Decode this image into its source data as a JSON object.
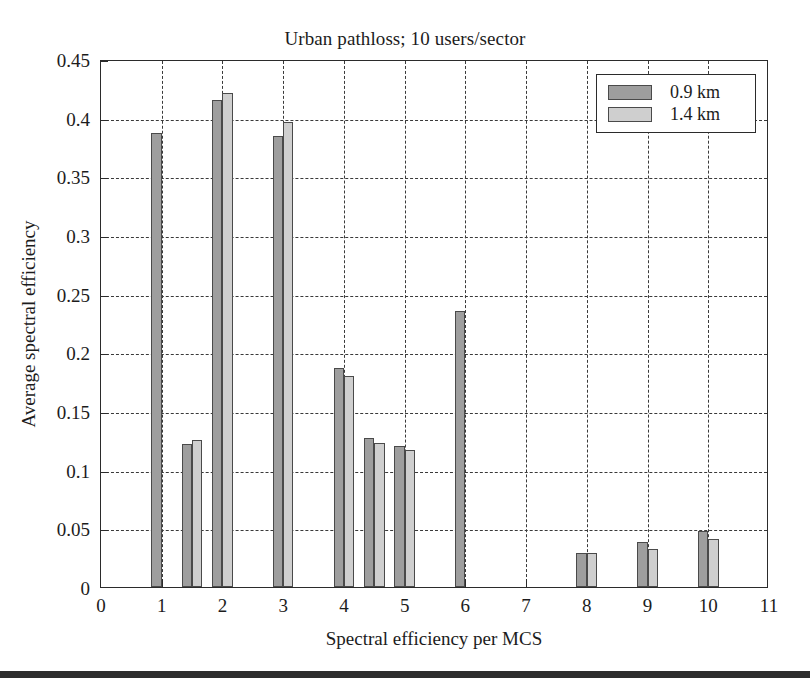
{
  "figure": {
    "background": "#ffffff",
    "frame_color": "#2b2b2b",
    "grid_color": "#3a3a3a"
  },
  "legend": {
    "position": "top-right",
    "entries": [
      {
        "label": "0.9 km",
        "color": "#9e9e9e"
      },
      {
        "label": "1.4 km",
        "color": "#cfcfcf"
      }
    ]
  },
  "chart_data": {
    "type": "bar",
    "title": "Urban pathloss; 10 users/sector",
    "xlabel": "Spectral efficiency per MCS",
    "ylabel": "Average spectral efficiency",
    "xlim": [
      0,
      11
    ],
    "ylim": [
      0,
      0.45
    ],
    "grid": true,
    "x_ticks": [
      0,
      1,
      2,
      3,
      4,
      5,
      6,
      7,
      8,
      9,
      10,
      11
    ],
    "x_tick_labels": [
      "0",
      "1",
      "2",
      "3",
      "4",
      "5",
      "6",
      "7",
      "8",
      "9",
      "10",
      "11"
    ],
    "y_ticks": [
      0,
      0.05,
      0.1,
      0.15,
      0.2,
      0.25,
      0.3,
      0.35,
      0.4,
      0.45
    ],
    "y_tick_labels": [
      "0",
      "0.05",
      "0.1",
      "0.15",
      "0.2",
      "0.25",
      "0.3",
      "0.35",
      "0.4",
      "0.45"
    ],
    "categories": [
      1,
      1.5,
      2,
      3,
      4,
      4.5,
      5,
      6,
      8,
      9,
      10
    ],
    "bar_width": 0.17,
    "series": [
      {
        "name": "0.9 km",
        "color": "#9e9e9e",
        "values": [
          0.387,
          0.122,
          0.415,
          0.384,
          0.187,
          0.127,
          0.12,
          0.235,
          0.029,
          0.038,
          0.048
        ]
      },
      {
        "name": "1.4 km",
        "color": "#cfcfcf",
        "values": [
          0.0,
          0.125,
          0.421,
          0.396,
          0.18,
          0.123,
          0.117,
          0.0,
          0.029,
          0.032,
          0.041
        ]
      }
    ]
  }
}
